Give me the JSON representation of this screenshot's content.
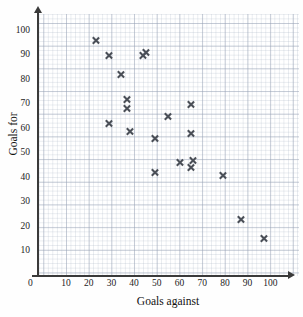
{
  "chart_data": {
    "type": "scatter",
    "title": "",
    "xlabel": "Goals against",
    "ylabel": "Goals for",
    "xlim": [
      0,
      105
    ],
    "ylim": [
      0,
      107
    ],
    "grid": true,
    "grid_style": "graph paper, major every 10 units, minor every 2 units",
    "legend": "none",
    "marker": "x",
    "marker_color": "#4a4f57",
    "xticks": [
      0,
      10,
      20,
      30,
      40,
      50,
      60,
      70,
      80,
      90,
      100
    ],
    "yticks": [
      0,
      10,
      20,
      30,
      40,
      50,
      60,
      70,
      80,
      90,
      100
    ],
    "points": [
      {
        "x": 23,
        "y": 96
      },
      {
        "x": 29,
        "y": 90
      },
      {
        "x": 34,
        "y": 82
      },
      {
        "x": 44,
        "y": 90
      },
      {
        "x": 45,
        "y": 91
      },
      {
        "x": 37,
        "y": 72
      },
      {
        "x": 37,
        "y": 68
      },
      {
        "x": 65,
        "y": 70
      },
      {
        "x": 55,
        "y": 65
      },
      {
        "x": 29,
        "y": 62
      },
      {
        "x": 38,
        "y": 59
      },
      {
        "x": 65,
        "y": 58
      },
      {
        "x": 49,
        "y": 56
      },
      {
        "x": 66,
        "y": 47
      },
      {
        "x": 60,
        "y": 46
      },
      {
        "x": 65,
        "y": 44
      },
      {
        "x": 49,
        "y": 42
      },
      {
        "x": 79,
        "y": 41
      },
      {
        "x": 87,
        "y": 23
      },
      {
        "x": 97,
        "y": 15
      }
    ]
  }
}
